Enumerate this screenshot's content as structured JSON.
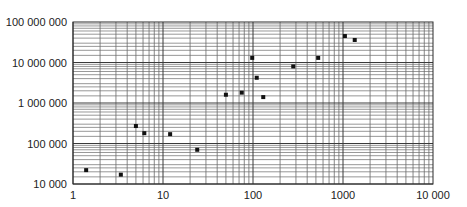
{
  "chart_data": {
    "type": "scatter",
    "title": "",
    "xlabel": "",
    "ylabel": "",
    "xscale": "log",
    "yscale": "log",
    "xlim": [
      1,
      10000
    ],
    "ylim": [
      10000,
      100000000
    ],
    "grid": true,
    "legend": null,
    "x_tick_labels": [
      "1",
      "10",
      "100",
      "1000",
      "10 000"
    ],
    "y_tick_labels": [
      "10 000",
      "100 000",
      "1 000 000",
      "10 000 000",
      "100 000 000"
    ],
    "series": [
      {
        "name": "data",
        "marker": "square",
        "color": "#111111",
        "points": [
          {
            "x": 1.4,
            "y": 22000
          },
          {
            "x": 3.4,
            "y": 17000
          },
          {
            "x": 5,
            "y": 270000
          },
          {
            "x": 6.2,
            "y": 180000
          },
          {
            "x": 12,
            "y": 170000
          },
          {
            "x": 24,
            "y": 70000
          },
          {
            "x": 50,
            "y": 1600000
          },
          {
            "x": 75,
            "y": 1800000
          },
          {
            "x": 98,
            "y": 13000000
          },
          {
            "x": 110,
            "y": 4200000
          },
          {
            "x": 130,
            "y": 1400000
          },
          {
            "x": 280,
            "y": 8000000
          },
          {
            "x": 530,
            "y": 13000000
          },
          {
            "x": 1050,
            "y": 45000000
          },
          {
            "x": 1350,
            "y": 36000000
          }
        ]
      }
    ]
  },
  "colors": {
    "grid": "#3a3a3a",
    "grid_minor": "#6a6a6a",
    "marker": "#111111",
    "text": "#222222"
  }
}
